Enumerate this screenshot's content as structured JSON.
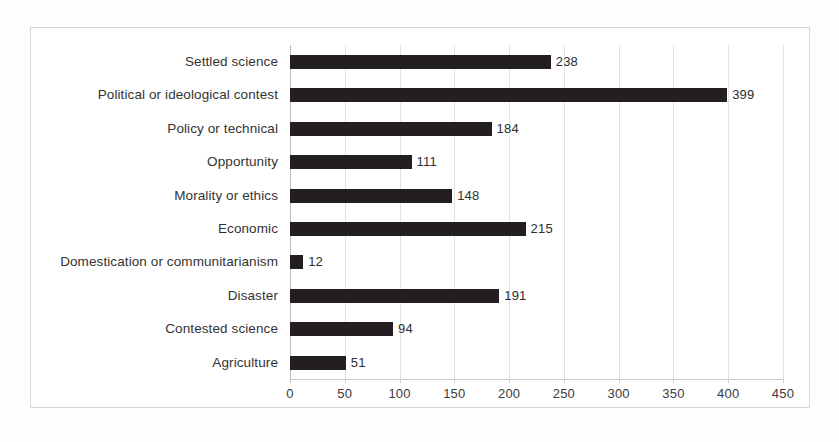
{
  "chart_data": {
    "type": "bar",
    "orientation": "horizontal",
    "title": "",
    "xlabel": "",
    "ylabel": "",
    "xlim": [
      0,
      450
    ],
    "xtick_step": 50,
    "xticks": [
      "0",
      "50",
      "100",
      "150",
      "200",
      "250",
      "300",
      "350",
      "400",
      "450"
    ],
    "grid": "vertical",
    "legend": "none",
    "bar_color": "#231f20",
    "categories": [
      "Settled science",
      "Political or ideological contest",
      "Policy or technical",
      "Opportunity",
      "Morality or ethics",
      "Economic",
      "Domestication or communitarianism",
      "Disaster",
      "Contested science",
      "Agriculture"
    ],
    "values": [
      238,
      399,
      184,
      111,
      148,
      215,
      12,
      191,
      94,
      51
    ],
    "data_labels": [
      "238",
      "399",
      "184",
      "111",
      "148",
      "215",
      "12",
      "191",
      "94",
      "51"
    ]
  },
  "colors": {
    "bar": "#231f20",
    "gridline": "#e2e2e2",
    "axis": "#c9c9c9",
    "frame": "#d6d6d6",
    "text": "#333333",
    "background": "#ffffff"
  }
}
